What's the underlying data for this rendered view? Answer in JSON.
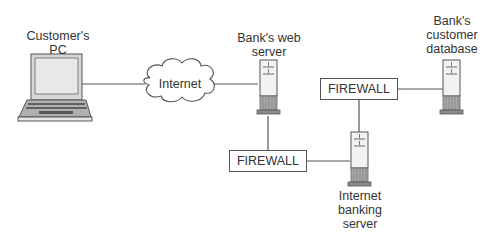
{
  "diagram": {
    "nodes": {
      "customer_pc": {
        "label_line1": "Customer's",
        "label_line2": "PC",
        "icon": "laptop-icon"
      },
      "internet": {
        "label": "Internet",
        "icon": "cloud-icon"
      },
      "web_server": {
        "label_line1": "Bank's web",
        "label_line2": "server",
        "icon": "server-icon"
      },
      "firewall_1": {
        "label": "FIREWALL"
      },
      "firewall_2": {
        "label": "FIREWALL"
      },
      "banking_server": {
        "label_line1": "Internet",
        "label_line2": "banking",
        "label_line3": "server",
        "icon": "server-icon"
      },
      "database": {
        "label_line1": "Bank's",
        "label_line2": "customer",
        "label_line3": "database",
        "icon": "server-icon"
      }
    },
    "edges": [
      [
        "customer_pc",
        "internet"
      ],
      [
        "internet",
        "web_server"
      ],
      [
        "web_server",
        "firewall_1"
      ],
      [
        "firewall_1",
        "banking_server"
      ],
      [
        "banking_server",
        "firewall_2"
      ],
      [
        "firewall_2",
        "database"
      ]
    ],
    "colors": {
      "line": "#555555",
      "fill_light": "#e6e6e6",
      "fill_dark": "#9a9a9a"
    }
  }
}
